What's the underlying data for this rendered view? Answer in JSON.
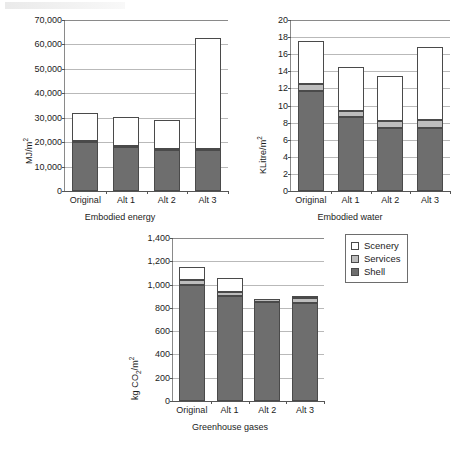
{
  "figure": {
    "legend": {
      "position": "top-right-of-panel-3",
      "items": [
        {
          "label": "Scenery",
          "color": "#ffffff",
          "swatch": "scenery-swatch"
        },
        {
          "label": "Services",
          "color": "#bdbdbd",
          "swatch": "services-swatch"
        },
        {
          "label": "Shell",
          "color": "#6e6e6e",
          "swatch": "shell-swatch"
        }
      ]
    }
  },
  "chart_data": [
    {
      "id": "embodied-energy",
      "type": "bar",
      "stacked": true,
      "title": "",
      "xlabel": "Embodied energy",
      "ylabel": "MJ/m2",
      "ylabel_display": "MJ/m²",
      "categories": [
        "Original",
        "Alt 1",
        "Alt 2",
        "Alt 3"
      ],
      "ylim": [
        0,
        70000
      ],
      "ytick_step": 10000,
      "yticks": [
        "0",
        "10,000",
        "20,000",
        "30,000",
        "40,000",
        "50,000",
        "60,000",
        "70,000"
      ],
      "grid": true,
      "series": [
        {
          "name": "Shell",
          "color": "#6e6e6e",
          "values": [
            19900,
            18000,
            16900,
            16900
          ]
        },
        {
          "name": "Services",
          "color": "#bdbdbd",
          "values": [
            400,
            350,
            300,
            300
          ]
        },
        {
          "name": "Scenery",
          "color": "#ffffff",
          "values": [
            11800,
            12050,
            12050,
            45300
          ]
        }
      ],
      "totals": [
        32100,
        30400,
        29250,
        62500
      ]
    },
    {
      "id": "embodied-water",
      "type": "bar",
      "stacked": true,
      "title": "",
      "xlabel": "Embodied water",
      "ylabel": "KLitre/m2",
      "ylabel_display": "KLitre/m²",
      "categories": [
        "Original",
        "Alt 1",
        "Alt 2",
        "Alt 3"
      ],
      "ylim": [
        0,
        20
      ],
      "ytick_step": 2,
      "yticks": [
        "0",
        "2",
        "4",
        "6",
        "8",
        "10",
        "12",
        "14",
        "16",
        "18",
        "20"
      ],
      "grid": true,
      "series": [
        {
          "name": "Shell",
          "color": "#6e6e6e",
          "values": [
            11.7,
            8.6,
            7.4,
            7.4
          ]
        },
        {
          "name": "Services",
          "color": "#bdbdbd",
          "values": [
            0.8,
            0.7,
            0.8,
            0.9
          ]
        },
        {
          "name": "Scenery",
          "color": "#ffffff",
          "values": [
            5.1,
            5.2,
            5.2,
            8.5
          ]
        }
      ],
      "totals": [
        17.6,
        14.5,
        13.4,
        16.8
      ]
    },
    {
      "id": "greenhouse-gases",
      "type": "bar",
      "stacked": true,
      "title": "",
      "xlabel": "Greenhouse gases",
      "ylabel": "kg CO2/m2",
      "ylabel_display": "kg CO₂/m²",
      "categories": [
        "Original",
        "Alt 1",
        "Alt 2",
        "Alt 3"
      ],
      "ylim": [
        0,
        1400
      ],
      "ytick_step": 200,
      "yticks": [
        "0",
        "200",
        "400",
        "600",
        "800",
        "1,000",
        "1,200",
        "1,400"
      ],
      "grid": true,
      "series": [
        {
          "name": "Shell",
          "color": "#6e6e6e",
          "values": [
            1000,
            900,
            850,
            845
          ]
        },
        {
          "name": "Services",
          "color": "#bdbdbd",
          "values": [
            35,
            40,
            30,
            40
          ]
        },
        {
          "name": "Scenery",
          "color": "#ffffff",
          "values": [
            115,
            120,
            0,
            20
          ]
        }
      ],
      "totals": [
        1150,
        1060,
        880,
        905
      ]
    }
  ]
}
